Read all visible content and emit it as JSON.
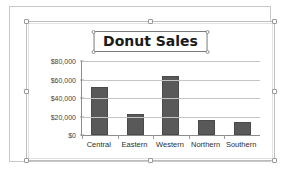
{
  "document": {
    "object_type": "chart-object",
    "selection_state": "selected"
  },
  "chart_data": {
    "type": "bar",
    "title": "Donut Sales",
    "xlabel": "",
    "ylabel": "",
    "categories": [
      "Central",
      "Eastern",
      "Western",
      "Northern",
      "Southern"
    ],
    "values": [
      51500,
      22500,
      63500,
      16000,
      14000
    ],
    "ylim": [
      0,
      80000
    ],
    "ytick_labels": [
      "$0",
      "$20,000",
      "$40,000",
      "$60,000",
      "$80,000"
    ],
    "ytick_values": [
      0,
      20000,
      40000,
      60000,
      80000
    ],
    "grid": true,
    "legend": false,
    "series_color": "#595959",
    "gridline_color": "#c4c4c4",
    "axis_color": "#8c8c8c"
  },
  "edge_marks": {
    "top": "::::",
    "bottom": "::::",
    "left": "::::",
    "right": "::::"
  }
}
